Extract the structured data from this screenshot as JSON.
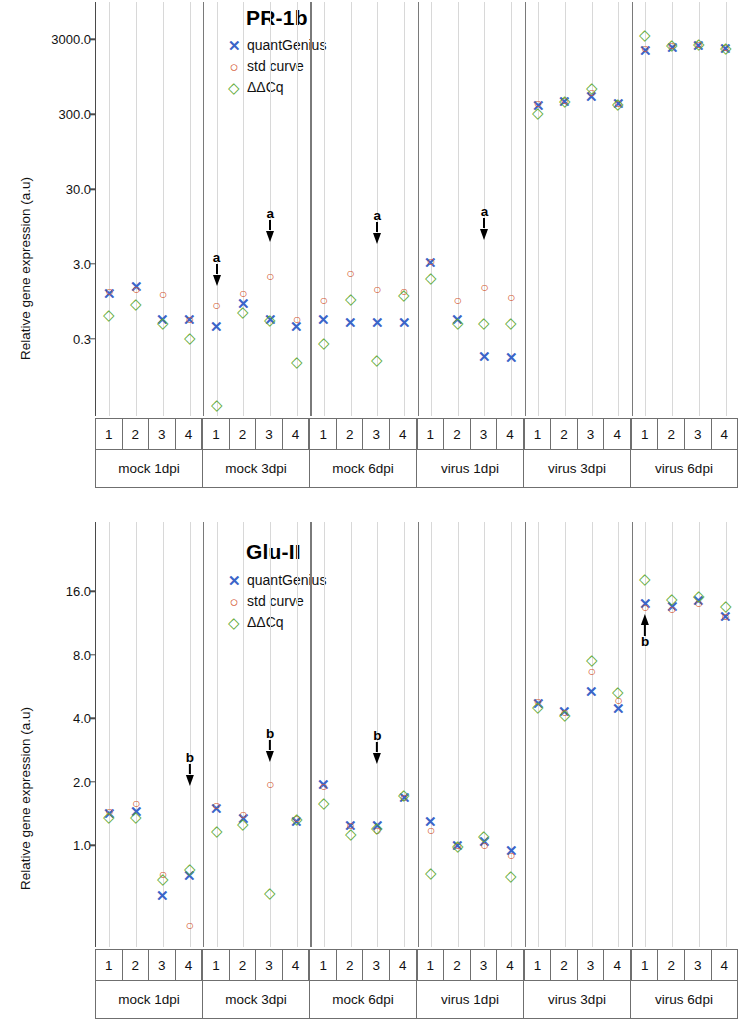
{
  "chart_data": [
    {
      "id": "pr1b",
      "type": "scatter",
      "title": "PR-1b",
      "ylabel": "Relative gene expression (a.u)",
      "xlabel": "",
      "yscale": "log",
      "yticks": [
        0.3,
        3.0,
        30.0,
        300.0,
        3000.0
      ],
      "ytick_labels": [
        "0.3",
        "3.0",
        "30.0",
        "300.0",
        "3000.0"
      ],
      "ylim": [
        0.03,
        9000
      ],
      "legend": [
        {
          "symbol": "✕",
          "label": "quantGenius",
          "color": "#3a64c8",
          "marker": "x"
        },
        {
          "symbol": "○",
          "label": "std curve",
          "color": "#d4562f",
          "marker": "o"
        },
        {
          "symbol": "◇",
          "label": "ΔΔCq",
          "color": "#5aa832",
          "marker": "d"
        }
      ],
      "groups": [
        "mock 1dpi",
        "mock 3dpi",
        "mock 6dpi",
        "virus 1dpi",
        "virus 3dpi",
        "virus 6dpi"
      ],
      "replicates": [
        "1",
        "2",
        "3",
        "4"
      ],
      "series": [
        {
          "name": "quantGenius",
          "marker": "x",
          "color": "#3a64c8",
          "values": [
            1.25,
            1.55,
            0.55,
            0.55,
            0.45,
            0.9,
            0.55,
            0.45,
            0.55,
            0.5,
            0.5,
            0.5,
            3.2,
            0.55,
            0.18,
            0.17,
            400,
            450,
            520,
            420,
            2200,
            2400,
            2500,
            2300
          ]
        },
        {
          "name": "std curve",
          "marker": "o",
          "color": "#d4562f",
          "values": [
            1.3,
            1.4,
            1.2,
            0.55,
            0.85,
            1.25,
            2.1,
            0.55,
            1.0,
            2.3,
            1.4,
            1.3,
            3.3,
            1.0,
            1.5,
            1.1,
            420,
            470,
            600,
            420,
            2300,
            2500,
            2600,
            2400
          ]
        },
        {
          "name": "ΔΔCq",
          "marker": "d",
          "color": "#5aa832",
          "values": [
            0.65,
            0.9,
            0.5,
            0.32,
            0.04,
            0.7,
            0.55,
            0.15,
            0.27,
            1.05,
            0.16,
            1.2,
            2.0,
            0.5,
            0.5,
            0.5,
            320,
            470,
            700,
            430,
            3600,
            2600,
            2700,
            2400
          ]
        }
      ],
      "annotations": [
        {
          "label": "a",
          "group": "mock 3dpi",
          "replicate": "1",
          "direction": "down"
        },
        {
          "label": "a",
          "group": "mock 3dpi",
          "replicate": "3",
          "direction": "down"
        },
        {
          "label": "a",
          "group": "mock 6dpi",
          "replicate": "3",
          "direction": "down"
        },
        {
          "label": "a",
          "group": "virus 1dpi",
          "replicate": "3",
          "direction": "down"
        }
      ]
    },
    {
      "id": "glu2",
      "type": "scatter",
      "title": "Glu-II",
      "ylabel": "Relative gene expression (a.u)",
      "xlabel": "",
      "yscale": "log",
      "yticks": [
        1.0,
        2.0,
        4.0,
        8.0,
        16.0
      ],
      "ytick_labels": [
        "1.0",
        "2.0",
        "4.0",
        "8.0",
        "16.0"
      ],
      "ylim": [
        0.35,
        30
      ],
      "legend": [
        {
          "symbol": "✕",
          "label": "quantGenius",
          "color": "#3a64c8",
          "marker": "x"
        },
        {
          "symbol": "○",
          "label": "std curve",
          "color": "#d4562f",
          "marker": "o"
        },
        {
          "symbol": "◇",
          "label": "ΔΔCq",
          "color": "#5aa832",
          "marker": "d"
        }
      ],
      "groups": [
        "mock 1dpi",
        "mock 3dpi",
        "mock 6dpi",
        "virus 1dpi",
        "virus 3dpi",
        "virus 6dpi"
      ],
      "replicates": [
        "1",
        "2",
        "3",
        "4"
      ],
      "series": [
        {
          "name": "quantGenius",
          "marker": "x",
          "color": "#3a64c8",
          "values": [
            1.42,
            1.45,
            0.58,
            0.72,
            1.5,
            1.35,
            null,
            1.3,
            1.95,
            1.25,
            1.25,
            1.7,
            1.3,
            1.0,
            1.05,
            0.95,
            4.7,
            4.35,
            5.4,
            4.45,
            14.0,
            13.6,
            14.5,
            12.2
          ]
        },
        {
          "name": "std curve",
          "marker": "o",
          "color": "#d4562f",
          "values": [
            1.45,
            1.58,
            0.73,
            0.42,
            1.55,
            1.4,
            1.95,
            1.35,
            1.9,
            1.25,
            1.18,
            1.7,
            1.18,
            1.0,
            1.0,
            0.9,
            4.85,
            4.3,
            6.7,
            4.9,
            13.5,
            13.2,
            14.0,
            12.2
          ]
        },
        {
          "name": "ΔΔCq",
          "marker": "d",
          "color": "#5aa832",
          "values": [
            1.38,
            1.38,
            0.7,
            0.78,
            1.18,
            1.28,
            0.6,
            1.35,
            1.6,
            1.15,
            1.22,
            1.75,
            0.75,
            1.0,
            1.12,
            0.72,
            4.55,
            4.2,
            7.6,
            5.4,
            18.5,
            14.8,
            15.3,
            13.8
          ]
        }
      ],
      "annotations": [
        {
          "label": "b",
          "group": "mock 1dpi",
          "replicate": "4",
          "direction": "down"
        },
        {
          "label": "b",
          "group": "mock 3dpi",
          "replicate": "3",
          "direction": "down"
        },
        {
          "label": "b",
          "group": "mock 6dpi",
          "replicate": "3",
          "direction": "down"
        },
        {
          "label": "b",
          "group": "virus 6dpi",
          "replicate": "1",
          "direction": "up"
        }
      ]
    }
  ],
  "panels": {
    "top": {
      "title": "PR-1b",
      "ylabel": "Relative gene expression (a.u)",
      "yticks": [
        "3000.0",
        "300.0",
        "30.0",
        "3.0",
        "0.3"
      ],
      "legend": {
        "quantgenius": "quantGenius",
        "stdcurve": "std curve",
        "ddcq": "ΔΔCq"
      },
      "groups": [
        "mock 1dpi",
        "mock 3dpi",
        "mock 6dpi",
        "virus 1dpi",
        "virus 3dpi",
        "virus 6dpi"
      ],
      "replicates": [
        "1",
        "2",
        "3",
        "4"
      ],
      "annotation_label": "a"
    },
    "bottom": {
      "title": "Glu-II",
      "ylabel": "Relative gene expression (a.u)",
      "yticks": [
        "16.0",
        "8.0",
        "4.0",
        "2.0",
        "1.0"
      ],
      "legend": {
        "quantgenius": "quantGenius",
        "stdcurve": "std curve",
        "ddcq": "ΔΔCq"
      },
      "groups": [
        "mock 1dpi",
        "mock 3dpi",
        "mock 6dpi",
        "virus 1dpi",
        "virus 3dpi",
        "virus 6dpi"
      ],
      "replicates": [
        "1",
        "2",
        "3",
        "4"
      ],
      "annotation_label": "b"
    }
  },
  "markers": {
    "x": "✕",
    "o": "○",
    "d": "◇"
  }
}
